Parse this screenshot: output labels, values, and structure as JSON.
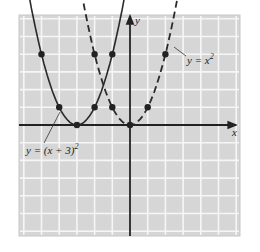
{
  "figure": {
    "x_axis_label": "x",
    "y_axis_label": "y",
    "curve1_label_prefix": "y = (x + 3)",
    "curve1_label_exp": "2",
    "curve2_label_prefix": "y = x",
    "curve2_label_exp": "2"
  },
  "chart_data": {
    "type": "line",
    "title": "",
    "xlabel": "x",
    "ylabel": "y",
    "xlim": [
      -6,
      6
    ],
    "ylim": [
      -6,
      6
    ],
    "grid": true,
    "series": [
      {
        "name": "y = (x + 3)^2",
        "style": "solid",
        "points": [
          [
            -5,
            4
          ],
          [
            -4,
            1
          ],
          [
            -3,
            0
          ],
          [
            -2,
            1
          ],
          [
            -1,
            4
          ]
        ]
      },
      {
        "name": "y = x^2",
        "style": "dashed",
        "points": [
          [
            -2,
            4
          ],
          [
            -1,
            1
          ],
          [
            0,
            0
          ],
          [
            1,
            1
          ],
          [
            2,
            4
          ]
        ]
      }
    ],
    "colors": {
      "panel": "#d4d4d4",
      "grid": "#f4f4f4",
      "curve": "#2a2a2a"
    }
  }
}
